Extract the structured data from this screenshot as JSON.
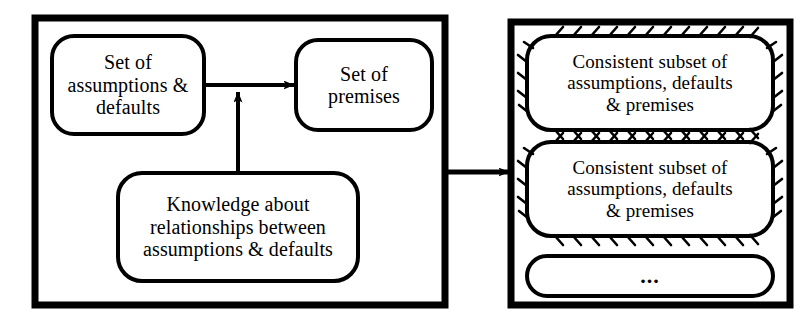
{
  "figure": {
    "type": "block-diagram",
    "background_color": "#ffffff",
    "stroke_color": "#000000"
  },
  "panels": [
    {
      "id": "input-panel",
      "name": "left-panel",
      "x": 35,
      "y": 18,
      "width": 410,
      "height": 287,
      "border_width": 7,
      "nodes": [
        {
          "id": "assumptions-defaults",
          "name": "set-of-assumptions-and-defaults-box",
          "text": "Set of\nassumptions &\ndefaults",
          "shape": "rounded-rectangle",
          "style": "solid",
          "x": 52,
          "y": 36,
          "width": 152,
          "height": 98,
          "radius": 22,
          "font_size": 20
        },
        {
          "id": "premises",
          "name": "set-of-premises-box",
          "text": "Set of\npremises",
          "shape": "rounded-rectangle",
          "style": "solid",
          "x": 296,
          "y": 40,
          "width": 136,
          "height": 90,
          "radius": 22,
          "font_size": 20
        },
        {
          "id": "knowledge",
          "name": "knowledge-about-relationships-box",
          "text": "Knowledge about\nrelationships between\nassumptions & defaults",
          "shape": "rounded-rectangle",
          "style": "solid",
          "x": 118,
          "y": 173,
          "width": 240,
          "height": 108,
          "radius": 24,
          "font_size": 20
        }
      ],
      "edges": [
        {
          "id": "assumptions-to-premises",
          "name": "arrow-assumptions-to-premises",
          "from": "assumptions-defaults",
          "to": "premises",
          "orientation": "horizontal",
          "arrowhead": "filled-triangle"
        },
        {
          "id": "knowledge-to-flow",
          "name": "arrow-knowledge-to-flow",
          "from": "knowledge",
          "to": "assumptions-to-premises",
          "orientation": "vertical-up",
          "arrowhead": "filled-triangle"
        }
      ]
    },
    {
      "id": "output-panel",
      "name": "right-panel",
      "x": 511,
      "y": 22,
      "width": 279,
      "height": 283,
      "border_width": 7,
      "nodes": [
        {
          "id": "consistent-subset-1",
          "name": "consistent-subset-box-1",
          "text": "Consistent subset of\nassumptions, defaults\n& premises",
          "shape": "rounded-rectangle",
          "style": "hatched",
          "x": 527,
          "y": 36,
          "width": 246,
          "height": 94,
          "radius": 24,
          "font_size": 19
        },
        {
          "id": "consistent-subset-2",
          "name": "consistent-subset-box-2",
          "text": "Consistent subset of\nassumptions, defaults\n& premises",
          "shape": "rounded-rectangle",
          "style": "hatched",
          "x": 527,
          "y": 142,
          "width": 246,
          "height": 94,
          "radius": 24,
          "font_size": 19
        },
        {
          "id": "more-subsets",
          "name": "ellipsis-box",
          "text": "...",
          "shape": "rounded-rectangle",
          "style": "solid",
          "x": 527,
          "y": 256,
          "width": 246,
          "height": 40,
          "radius": 20,
          "font_size": 22
        }
      ]
    }
  ],
  "connector": {
    "id": "panel-connector",
    "name": "arrow-left-panel-to-right-panel",
    "from": "input-panel",
    "to": "output-panel",
    "orientation": "horizontal",
    "arrowhead": "filled-triangle",
    "x1": 444,
    "x2": 509,
    "y": 172
  }
}
